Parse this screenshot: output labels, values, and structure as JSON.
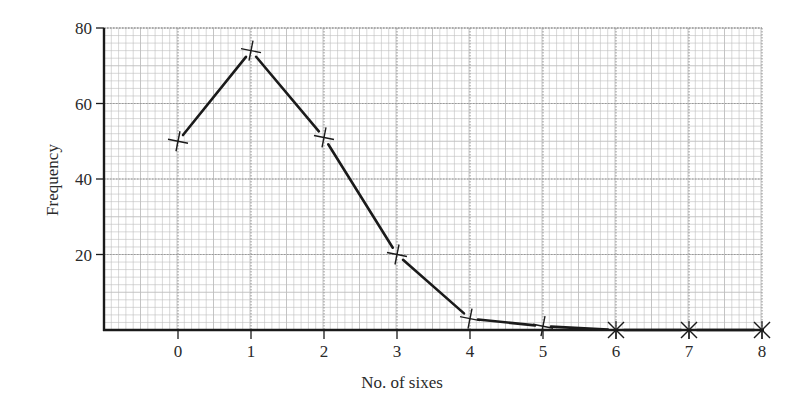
{
  "chart_data": {
    "type": "line",
    "title": "",
    "xlabel": "No. of sixes",
    "ylabel": "Frequency",
    "x": [
      0,
      1,
      2,
      3,
      4,
      5,
      6,
      7,
      8
    ],
    "categories": [
      "0",
      "1",
      "2",
      "3",
      "4",
      "5",
      "6",
      "7",
      "8"
    ],
    "values": [
      50,
      74,
      51,
      20,
      3,
      1,
      0,
      0,
      0
    ],
    "series": [
      {
        "name": "Frequency",
        "marker": "cross",
        "values": [
          50,
          74,
          51,
          20,
          3,
          1,
          0,
          0,
          0
        ]
      }
    ],
    "xlim": [
      -1,
      8
    ],
    "ylim": [
      0,
      80
    ],
    "x_ticks": [
      "0",
      "1",
      "2",
      "3",
      "4",
      "5",
      "6",
      "7",
      "8"
    ],
    "y_ticks": [
      "20",
      "40",
      "60",
      "80"
    ],
    "grid": true,
    "grid_style": "graph paper: minor squares of 2 frequency units, dotted major lines at every integer x and every 20 frequency units",
    "legend": null
  },
  "colors": {
    "line": "#1a1a1a",
    "grid_minor": "#bdbdbd",
    "grid_major": "#9a9a9a",
    "axis": "#1a1a1a",
    "text": "#2a2a2a",
    "background": "#ffffff"
  }
}
